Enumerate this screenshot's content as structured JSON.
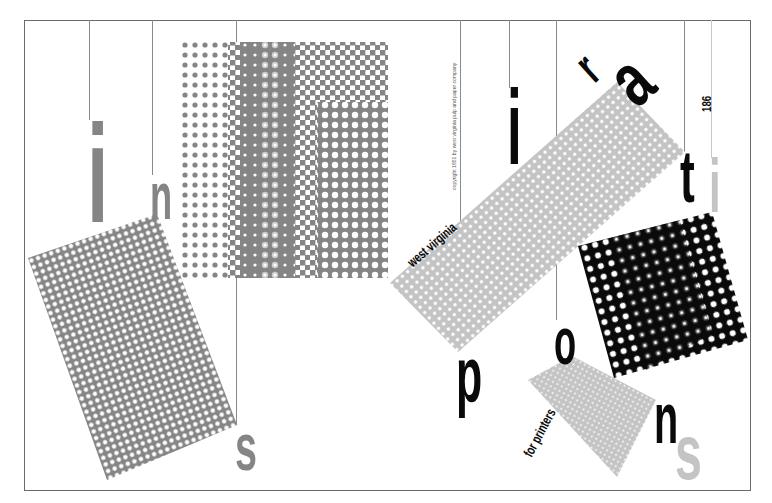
{
  "poster": {
    "title_letters": {
      "i1": "i",
      "n1": "n",
      "s1": "s",
      "i2": "i",
      "r": "r",
      "a": "a",
      "t": "t",
      "i3": "i",
      "p": "p",
      "o": "o",
      "n2": "n",
      "s2": "s"
    },
    "word": "inspirations",
    "subtitle_top": "west virginia",
    "subtitle_bottom": "for printers",
    "copyright": "copyright 1951 by west virginia pulp and paper company",
    "page_number": "186"
  },
  "colors": {
    "background": "#ffffff",
    "frame": "#6a6a6a",
    "rule": "#8a8a8a",
    "mid_gray": "#858585",
    "light_gray": "#c4c4c4",
    "black": "#0a0a0a"
  }
}
